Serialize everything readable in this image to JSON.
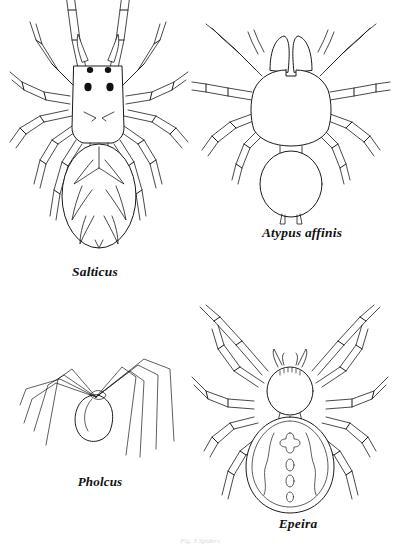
{
  "plate": {
    "background_color": "#ffffff",
    "ink_color": "#1a1a1a",
    "caption_partial": "Fig. 3 Spiders"
  },
  "figures": [
    {
      "id": "salticus",
      "label": "Salticus",
      "common_description": "jumping spider, dorsal view",
      "features": "rectangular cephalothorax, four black eyes, leaf-patterned oval abdomen, eight segmented legs"
    },
    {
      "id": "atypus",
      "label": "Atypus affinis",
      "common_description": "purseweb spider, dorsal view",
      "features": "large paired chelicerae, shield cephalothorax, oval abdomen with two spinnerets"
    },
    {
      "id": "pholcus",
      "label": "Pholcus",
      "common_description": "cellar spider, side view",
      "features": "extremely long thin legs radiating from small egg-shaped body"
    },
    {
      "id": "epeira",
      "label": "Epeira",
      "common_description": "garden cross spider, dorsal view",
      "features": "round cephalothorax, large oval abdomen bearing a cross marking and three spots"
    }
  ]
}
